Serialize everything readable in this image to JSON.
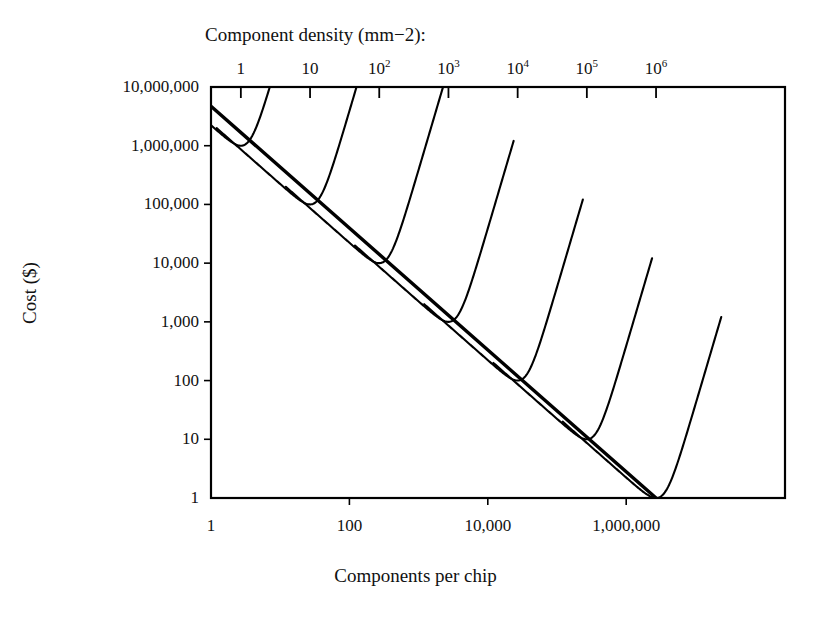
{
  "chart_data": {
    "type": "line",
    "title": "",
    "top_axis_label": "Component density (mm−2):",
    "xlabel": "Components per chip",
    "ylabel": "Cost ($)",
    "xscale": "log",
    "yscale": "log",
    "xlim": [
      1,
      200000000
    ],
    "ylim": [
      1,
      10000000
    ],
    "grid": false,
    "legend": "none",
    "xticks": [
      {
        "value": 1,
        "label": "1"
      },
      {
        "value": 100,
        "label": "100"
      },
      {
        "value": 10000,
        "label": "10,000"
      },
      {
        "value": 1000000,
        "label": "1,000,000"
      }
    ],
    "yticks": [
      {
        "value": 10000000,
        "label": "10,000,000"
      },
      {
        "value": 1000000,
        "label": "1,000,000"
      },
      {
        "value": 100000,
        "label": "100,000"
      },
      {
        "value": 10000,
        "label": "10,000"
      },
      {
        "value": 1000,
        "label": "1,000"
      },
      {
        "value": 100,
        "label": "100"
      },
      {
        "value": 10,
        "label": "10"
      },
      {
        "value": 1,
        "label": "1"
      }
    ],
    "top_axis_ticks": [
      {
        "x_value": 2.7,
        "label": "1",
        "sup": ""
      },
      {
        "x_value": 27,
        "label": "10",
        "sup": ""
      },
      {
        "x_value": 270,
        "label": "10",
        "sup": "2"
      },
      {
        "x_value": 2700,
        "label": "10",
        "sup": "3"
      },
      {
        "x_value": 27000,
        "label": "10",
        "sup": "4"
      },
      {
        "x_value": 270000,
        "label": "10",
        "sup": "5"
      },
      {
        "x_value": 2700000,
        "label": "10",
        "sup": "6"
      }
    ],
    "envelope": {
      "name": "minimum-cost envelope",
      "x": [
        1,
        2700000
      ],
      "y": [
        4700000,
        1.0
      ],
      "description": "straight descending line tangent to every curve minimum"
    },
    "series": [
      {
        "name": "density 1 mm^-2",
        "density": 1,
        "min_x": 2.7,
        "min_y": 1000000
      },
      {
        "name": "density 10 mm^-2",
        "density": 10,
        "min_x": 27,
        "min_y": 100000
      },
      {
        "name": "density 10^2 mm^-2",
        "density": 100,
        "min_x": 270,
        "min_y": 10000
      },
      {
        "name": "density 10^3 mm^-2",
        "density": 1000,
        "min_x": 2700,
        "min_y": 1000
      },
      {
        "name": "density 10^4 mm^-2",
        "density": 10000,
        "min_x": 27000,
        "min_y": 100
      },
      {
        "name": "density 10^5 mm^-2",
        "density": 100000,
        "min_x": 270000,
        "min_y": 10
      },
      {
        "name": "density 10^6 mm^-2",
        "density": 1000000,
        "min_x": 2700000,
        "min_y": 1
      }
    ],
    "colors": {
      "curve": "#000000",
      "envelope": "#000000",
      "axis": "#000000",
      "background": "#ffffff"
    }
  }
}
